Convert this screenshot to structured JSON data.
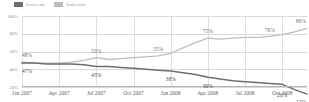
{
  "legend": {
    "items": [
      {
        "label": "Series one",
        "color": "#6e6e6e",
        "swatch_name": "legend-swatch-dark"
      },
      {
        "label": "Series two",
        "color": "#bdbdbd",
        "swatch_name": "legend-swatch-light"
      }
    ]
  },
  "axes": {
    "y_ticks": [
      "100%",
      "80%",
      "60%",
      "40%",
      "20%"
    ],
    "x_ticks": [
      "Jan 2007",
      "Apr 2007",
      "Jul 2007",
      "Oct 2007",
      "Jan 2008",
      "Apr 2008",
      "Jul 2008",
      "Oct 2008"
    ]
  },
  "chart_data": {
    "type": "line",
    "title": "",
    "xlabel": "",
    "ylabel": "",
    "ylim": [
      20,
      100
    ],
    "grid": true,
    "legend_position": "top-left",
    "x": [
      "Jan 2007",
      "Feb 2007",
      "Mar 2007",
      "Apr 2007",
      "May 2007",
      "Jun 2007",
      "Jul 2007",
      "Aug 2007",
      "Sep 2007",
      "Oct 2007",
      "Nov 2007",
      "Dec 2007",
      "Jan 2008",
      "Feb 2008",
      "Mar 2008",
      "Apr 2008",
      "May 2008",
      "Jun 2008",
      "Jul 2008",
      "Aug 2008",
      "Sep 2008",
      "Oct 2008",
      "Nov 2008",
      "Dec 2008"
    ],
    "series": [
      {
        "name": "Series two",
        "color": "#bdbdbd",
        "values": [
          48,
          47,
          47,
          47,
          48,
          50,
          53,
          51,
          52,
          53,
          54,
          55,
          58,
          64,
          70,
          75,
          74,
          75,
          76,
          76,
          77,
          79,
          82,
          86
        ],
        "labels": [
          {
            "x": "Jan 2007",
            "value": 48,
            "text": "48%"
          },
          {
            "x": "Jul 2007",
            "value": 53,
            "text": "53%"
          },
          {
            "x": "Dec 2007",
            "value": 55,
            "text": "55%"
          },
          {
            "x": "Apr 2008",
            "value": 75,
            "text": "75%"
          },
          {
            "x": "Sep 2008",
            "value": 76,
            "text": "76%"
          },
          {
            "x": "Dec 2008",
            "value": 86,
            "text": "86%"
          }
        ]
      },
      {
        "name": "Series one",
        "color": "#6e6e6e",
        "values": [
          47,
          47,
          46,
          46,
          46,
          45,
          43,
          43,
          42,
          41,
          40,
          39,
          38,
          36,
          34,
          31,
          29,
          27,
          26,
          25,
          24,
          23,
          17,
          12
        ],
        "labels": [
          {
            "x": "Jan 2007",
            "value": 47,
            "text": "47%"
          },
          {
            "x": "Jul 2007",
            "value": 43,
            "text": "43%"
          },
          {
            "x": "Jan 2008",
            "value": 38,
            "text": "38%"
          },
          {
            "x": "Apr 2008",
            "value": 30,
            "text": "30%"
          },
          {
            "x": "Oct 2008",
            "value": 20,
            "text": "20%"
          },
          {
            "x": "Dec 2008",
            "value": 12,
            "text": "12%"
          }
        ]
      }
    ]
  }
}
